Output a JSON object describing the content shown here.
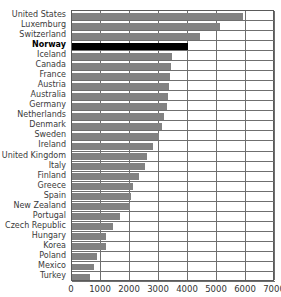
{
  "chart_data": {
    "type": "bar",
    "orientation": "horizontal",
    "title": "",
    "xlabel": "",
    "ylabel": "",
    "xlim": [
      0,
      7000
    ],
    "xticks": [
      0,
      1000,
      2000,
      3000,
      4000,
      5000,
      6000,
      7000
    ],
    "xtick_labels": [
      "0",
      "1000",
      "2000",
      "3000",
      "4000",
      "5000",
      "6000",
      "7000"
    ],
    "grid": true,
    "legend": "none",
    "bar_color": "#828282",
    "highlight_color": "#000000",
    "highlight_category": "Norway",
    "categories": [
      "United States",
      "Luxemburg",
      "Switzerland",
      "Norway",
      "Iceland",
      "Canada",
      "France",
      "Austria",
      "Australia",
      "Germany",
      "Netherlands",
      "Denmark",
      "Sweden",
      "Ireland",
      "United Kingdom",
      "Italy",
      "Finland",
      "Greece",
      "Spain",
      "New Zealand",
      "Portugal",
      "Czech Republic",
      "Hungary",
      "Korea",
      "Poland",
      "Mexico",
      "Turkey"
    ],
    "values": [
      5900,
      5100,
      4400,
      4000,
      3440,
      3400,
      3380,
      3350,
      3300,
      3280,
      3160,
      3100,
      3000,
      2800,
      2600,
      2500,
      2300,
      2100,
      2050,
      2000,
      1650,
      1400,
      1180,
      1180,
      850,
      750,
      620
    ]
  }
}
